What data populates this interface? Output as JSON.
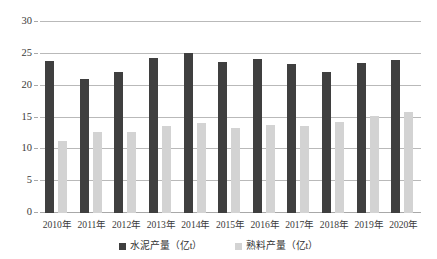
{
  "chart_data": {
    "type": "bar",
    "title": "",
    "xlabel": "",
    "ylabel": "",
    "ylim": [
      0,
      30
    ],
    "yticks": [
      0,
      5,
      10,
      15,
      20,
      25,
      30
    ],
    "grid": true,
    "legend_position": "bottom",
    "categories": [
      "2010年",
      "2011年",
      "2012年",
      "2013年",
      "2014年",
      "2015年",
      "2016年",
      "2017年",
      "2018年",
      "2019年",
      "2020年"
    ],
    "series": [
      {
        "name": "水泥产量（亿t）",
        "color": "#3f3f3f",
        "values": [
          23.9,
          21.0,
          22.1,
          24.3,
          25.1,
          23.7,
          24.2,
          23.4,
          22.2,
          23.6,
          24.1
        ]
      },
      {
        "name": "熟料产量（亿t）",
        "color": "#d3d3d3",
        "values": [
          11.3,
          12.8,
          12.8,
          13.6,
          14.2,
          13.4,
          13.8,
          13.6,
          14.3,
          15.2,
          15.9
        ]
      }
    ]
  },
  "axis": {
    "ytick_labels": [
      "30",
      "25",
      "20",
      "15",
      "10",
      "5",
      "0"
    ]
  },
  "legend": {
    "items": [
      {
        "label": "水泥产量（亿t）",
        "swatch": "dark-square-icon"
      },
      {
        "label": "熟料产量（亿t）",
        "swatch": "light-square-icon"
      }
    ]
  }
}
